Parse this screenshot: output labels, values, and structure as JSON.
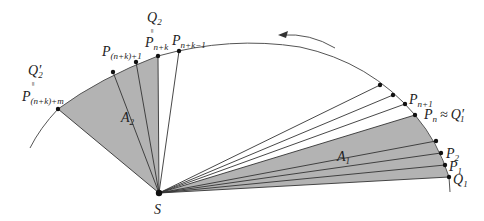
{
  "diagram": {
    "colors": {
      "shade": "#b3b3b3",
      "line": "#333333",
      "orbit": "#555555",
      "point": "#111111"
    },
    "focus": {
      "label": "S"
    },
    "areas": [
      {
        "label": "A",
        "sub": "1"
      },
      {
        "label": "A",
        "sub": "2"
      }
    ],
    "points": {
      "Q1": {
        "label": "Q",
        "sub": "1"
      },
      "P1": {
        "label": "P",
        "sub": "1"
      },
      "P2": {
        "label": "P",
        "sub": "2"
      },
      "Pn": {
        "label": "P",
        "sub": "n",
        "rel": "≈",
        "rhs": "Q",
        "rhs_prime": "′",
        "rhs_sub": "1"
      },
      "Pn1": {
        "label": "P",
        "sub": "n+1"
      },
      "Pnk1": {
        "label": "P",
        "sub": "n+k−1"
      },
      "Q2": {
        "label": "Q",
        "sub": "2",
        "eq": "=",
        "below": "P",
        "below_sub": "n+k"
      },
      "Pnk_1": {
        "label": "P",
        "sub": "(n+k)+1"
      },
      "Q2p": {
        "label": "Q",
        "prime": "′",
        "sub": "2",
        "eq": "=",
        "below": "P",
        "below_sub": "(n+k)+m"
      }
    },
    "direction_arrow": "counterclockwise"
  }
}
